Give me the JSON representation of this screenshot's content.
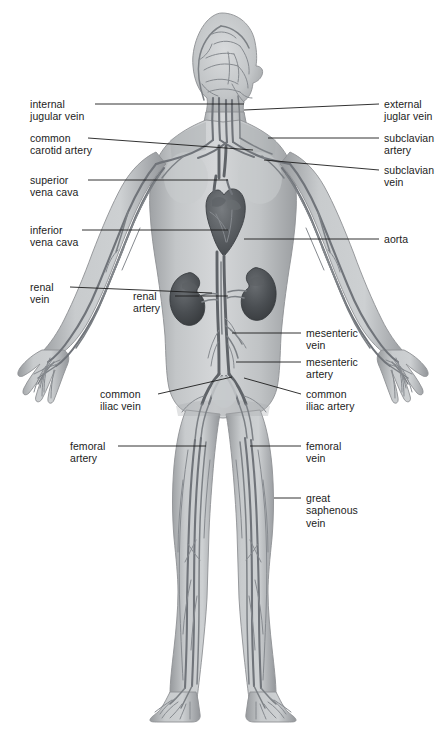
{
  "figure": {
    "background_color": "#ffffff",
    "ink_color": "#1c1c1c",
    "body_fill": "#b9bbbd",
    "vessel_color": "#6e7276",
    "organ_color": "#4d5154"
  },
  "labels": {
    "left": [
      {
        "id": "internal-jugular-vein",
        "lines": [
          "internal",
          "jugular vein"
        ],
        "x": 30,
        "y": 98,
        "leader": {
          "x1": 95,
          "y1": 104,
          "x2": 244,
          "y2": 104
        }
      },
      {
        "id": "common-carotid-artery",
        "lines": [
          "common",
          "carotid artery"
        ],
        "x": 30,
        "y": 132,
        "leader": {
          "x1": 88,
          "y1": 138,
          "x2": 253,
          "y2": 150
        }
      },
      {
        "id": "superior-vena-cava",
        "lines": [
          "superior",
          "vena cava"
        ],
        "x": 30,
        "y": 174,
        "leader": {
          "x1": 88,
          "y1": 180,
          "x2": 228,
          "y2": 180
        }
      },
      {
        "id": "inferior-vena-cava",
        "lines": [
          "inferior",
          "vena cava"
        ],
        "x": 30,
        "y": 224,
        "leader": {
          "x1": 82,
          "y1": 230,
          "x2": 228,
          "y2": 230
        }
      },
      {
        "id": "renal-vein",
        "lines": [
          "renal",
          "vein"
        ],
        "x": 30,
        "y": 281,
        "leader": {
          "x1": 70,
          "y1": 287,
          "x2": 212,
          "y2": 293
        }
      },
      {
        "id": "renal-artery",
        "lines": [
          "renal",
          "artery"
        ],
        "x": 133,
        "y": 290,
        "leader": {
          "x1": 175,
          "y1": 296,
          "x2": 228,
          "y2": 296
        }
      },
      {
        "id": "common-iliac-vein",
        "lines": [
          "common",
          "iliac vein"
        ],
        "x": 100,
        "y": 388,
        "leader": {
          "x1": 158,
          "y1": 394,
          "x2": 232,
          "y2": 377
        }
      },
      {
        "id": "femoral-artery",
        "lines": [
          "femoral",
          "artery"
        ],
        "x": 70,
        "y": 440,
        "leader": {
          "x1": 118,
          "y1": 446,
          "x2": 206,
          "y2": 446
        }
      }
    ],
    "right": [
      {
        "id": "external-jugular-vein",
        "lines": [
          "external",
          "juglar vein"
        ],
        "x": 384,
        "y": 98,
        "leader": {
          "x1": 379,
          "y1": 104,
          "x2": 244,
          "y2": 110
        }
      },
      {
        "id": "subclavian-artery",
        "lines": [
          "subclavian",
          "artery"
        ],
        "x": 384,
        "y": 132,
        "leader": {
          "x1": 379,
          "y1": 138,
          "x2": 268,
          "y2": 138
        }
      },
      {
        "id": "subclavian-vein",
        "lines": [
          "subclavian",
          "vein"
        ],
        "x": 384,
        "y": 164,
        "leader": {
          "x1": 379,
          "y1": 170,
          "x2": 264,
          "y2": 160
        }
      },
      {
        "id": "aorta",
        "lines": [
          "aorta"
        ],
        "x": 384,
        "y": 233,
        "leader": {
          "x1": 379,
          "y1": 239,
          "x2": 244,
          "y2": 239
        }
      },
      {
        "id": "mesenteric-vein",
        "lines": [
          "mesenteric",
          "vein"
        ],
        "x": 306,
        "y": 327,
        "leader": {
          "x1": 301,
          "y1": 333,
          "x2": 232,
          "y2": 333
        }
      },
      {
        "id": "mesenteric-artery",
        "lines": [
          "mesenteric",
          "artery"
        ],
        "x": 306,
        "y": 356,
        "leader": {
          "x1": 301,
          "y1": 362,
          "x2": 236,
          "y2": 362
        }
      },
      {
        "id": "common-iliac-artery",
        "lines": [
          "common",
          "iliac artery"
        ],
        "x": 306,
        "y": 388,
        "leader": {
          "x1": 301,
          "y1": 394,
          "x2": 244,
          "y2": 378
        }
      },
      {
        "id": "femoral-vein",
        "lines": [
          "femoral",
          "vein"
        ],
        "x": 306,
        "y": 440,
        "leader": {
          "x1": 301,
          "y1": 446,
          "x2": 250,
          "y2": 446
        }
      },
      {
        "id": "great-saphenous-vein",
        "lines": [
          "great",
          "saphenous",
          "vein"
        ],
        "x": 306,
        "y": 492,
        "leader": {
          "x1": 301,
          "y1": 498,
          "x2": 274,
          "y2": 498
        }
      }
    ]
  }
}
